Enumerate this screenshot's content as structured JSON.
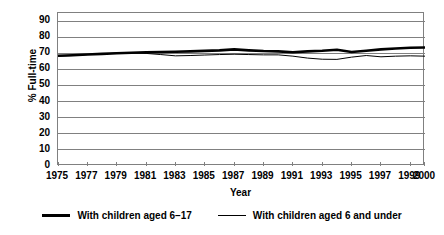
{
  "chart_data": {
    "type": "line",
    "title": "",
    "xlabel": "Year",
    "ylabel": "% Full-time",
    "xlim": [
      1975,
      2000
    ],
    "ylim": [
      0,
      95
    ],
    "yticks": [
      0,
      10,
      20,
      30,
      40,
      50,
      60,
      70,
      80,
      90
    ],
    "xticks": [
      1975,
      1977,
      1979,
      1981,
      1983,
      1985,
      1987,
      1989,
      1991,
      1993,
      1995,
      1997,
      1999,
      2000
    ],
    "xtick_labels": [
      "1975",
      "1977",
      "1979",
      "1981",
      "1983",
      "1985",
      "1987",
      "1989",
      "1991",
      "1993",
      "1995",
      "1997",
      "1999",
      "2000"
    ],
    "ytick_labels": [
      "0",
      "10",
      "20",
      "30",
      "40",
      "50",
      "60",
      "70",
      "80",
      "90"
    ],
    "grid": "horizontal",
    "legend_position": "below",
    "x": [
      1975,
      1976,
      1977,
      1978,
      1979,
      1980,
      1981,
      1982,
      1983,
      1984,
      1985,
      1986,
      1987,
      1988,
      1989,
      1990,
      1991,
      1992,
      1993,
      1994,
      1995,
      1996,
      1997,
      1998,
      1999,
      2000
    ],
    "series": [
      {
        "name": "With children aged 6–17",
        "color": "#000000",
        "line_width": 2.6,
        "values": [
          68.5,
          68.8,
          69.2,
          69.6,
          70.0,
          70.3,
          70.6,
          70.8,
          70.9,
          71.2,
          71.5,
          71.8,
          72.4,
          71.8,
          71.4,
          71.2,
          70.6,
          71.2,
          71.6,
          72.2,
          70.8,
          71.6,
          72.4,
          73.0,
          73.4,
          73.6
        ]
      },
      {
        "name": "With children aged 6 and under",
        "color": "#000000",
        "line_width": 1.0,
        "values": [
          68.2,
          68.6,
          69.2,
          69.6,
          70.1,
          70.2,
          69.9,
          69.2,
          68.4,
          68.6,
          68.9,
          69.2,
          69.4,
          69.2,
          69.0,
          69.0,
          68.2,
          67.0,
          66.3,
          66.2,
          67.6,
          68.6,
          67.8,
          68.2,
          68.4,
          68.2
        ]
      }
    ]
  },
  "legend": {
    "items": [
      {
        "label": "With children aged 6–17",
        "style": "thick"
      },
      {
        "label": "With children aged 6 and under",
        "style": "thin"
      }
    ]
  },
  "colors": {
    "axis": "#808080",
    "gridline": "#808080",
    "line": "#000000",
    "background": "#ffffff"
  }
}
